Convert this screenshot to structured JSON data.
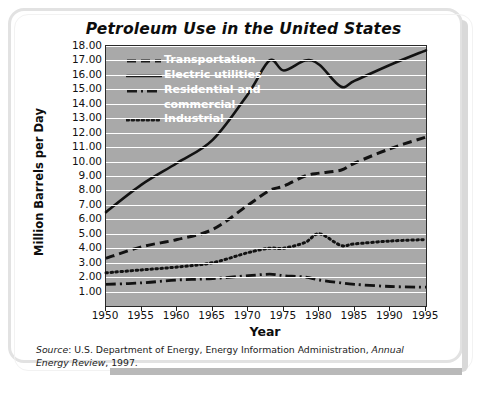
{
  "chart_data": {
    "type": "line",
    "title": "Petroleum Use in the United States",
    "xlabel": "Year",
    "ylabel": "Million Barrels per Day",
    "xlim": [
      1950,
      1995
    ],
    "ylim": [
      0,
      18
    ],
    "grid": true,
    "legend_position": "top-left-inside",
    "xticks": [
      "1950",
      "1955",
      "1960",
      "1965",
      "1970",
      "1975",
      "1980",
      "1985",
      "1990",
      "1995"
    ],
    "yticks": [
      "1.00",
      "2.00",
      "3.00",
      "4.00",
      "5.00",
      "6.00",
      "7.00",
      "8.00",
      "9.00",
      "10.00",
      "11.00",
      "12.00",
      "13.00",
      "14.00",
      "15.00",
      "16.00",
      "17.00",
      "18.00"
    ],
    "x": [
      1950,
      1955,
      1960,
      1965,
      1970,
      1973,
      1975,
      1978,
      1980,
      1983,
      1985,
      1990,
      1995
    ],
    "series": [
      {
        "name": "Transportation",
        "style": "dashed",
        "values": [
          3.3,
          4.1,
          4.6,
          5.3,
          7.0,
          8.0,
          8.3,
          9.0,
          9.2,
          9.4,
          9.9,
          10.9,
          11.7
        ]
      },
      {
        "name": "Electric utilities",
        "style": "solid",
        "values": [
          6.5,
          8.4,
          9.9,
          11.5,
          14.7,
          17.0,
          16.3,
          17.0,
          16.7,
          15.2,
          15.6,
          16.7,
          17.7
        ]
      },
      {
        "name": "Residential and commercial",
        "style": "dash-dot",
        "values": [
          1.5,
          1.6,
          1.8,
          1.9,
          2.1,
          2.2,
          2.1,
          2.0,
          1.8,
          1.6,
          1.5,
          1.35,
          1.3
        ]
      },
      {
        "name": "Industrial",
        "style": "dotted",
        "values": [
          2.3,
          2.5,
          2.7,
          3.0,
          3.7,
          4.0,
          4.0,
          4.4,
          5.0,
          4.2,
          4.3,
          4.5,
          4.6
        ]
      }
    ]
  },
  "source": {
    "label": "Source",
    "text_part1": ": U.S. Department of Energy, Energy Information Administration, ",
    "italic_part": "Annual Energy Review",
    "text_part2": ", 1997."
  },
  "colors": {
    "plot_background": "#a9a9a9",
    "gridline": "#ffffff",
    "line": "#121212",
    "legend_text": "#ffffff",
    "frame": "#e2e2e2"
  }
}
